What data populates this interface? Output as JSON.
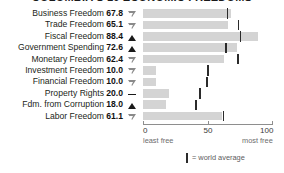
{
  "chart_data": {
    "type": "bar",
    "title": "COLOMBIA'S 10 ECONOMIC FREEDOMS",
    "xlabel": "",
    "ylabel": "",
    "xlim": [
      0,
      100
    ],
    "grid": false,
    "orientation": "horizontal",
    "legend": "= world average",
    "axis": {
      "ticks": [
        {
          "value": 0,
          "label": "0",
          "sublabel": "least free"
        },
        {
          "value": 50,
          "label": "50",
          "sublabel": ""
        },
        {
          "value": 100,
          "label": "100",
          "sublabel": "most free"
        }
      ]
    },
    "categories": [
      "Business Freedom",
      "Trade Freedom",
      "Fiscal Freedom",
      "Government Spending",
      "Monetary Freedom",
      "Investment Freedom",
      "Financial Freedom",
      "Property Rights",
      "Fdm. from Corruption",
      "Labor Freedom"
    ],
    "values": [
      67.8,
      65.1,
      88.4,
      72.6,
      62.4,
      10.0,
      10.0,
      20.0,
      18.0,
      61.1
    ],
    "world_average": [
      65.0,
      73.5,
      75.0,
      64.0,
      73.0,
      50.0,
      49.0,
      44.0,
      40.5,
      62.0
    ],
    "trend": [
      "down",
      "down",
      "up",
      "up",
      "down",
      "down",
      "down",
      "flat",
      "up",
      "down"
    ],
    "series": [
      {
        "name": "score",
        "values": [
          67.8,
          65.1,
          88.4,
          72.6,
          62.4,
          10.0,
          10.0,
          20.0,
          18.0,
          61.1
        ]
      }
    ]
  },
  "rows": [
    {
      "label": "Business Freedom",
      "value": "67.8",
      "trend": "down"
    },
    {
      "label": "Trade Freedom",
      "value": "65.1",
      "trend": "down"
    },
    {
      "label": "Fiscal Freedom",
      "value": "88.4",
      "trend": "up"
    },
    {
      "label": "Government Spending",
      "value": "72.6",
      "trend": "up"
    },
    {
      "label": "Monetary Freedom",
      "value": "62.4",
      "trend": "down"
    },
    {
      "label": "Investment Freedom",
      "value": "10.0",
      "trend": "down"
    },
    {
      "label": "Financial Freedom",
      "value": "10.0",
      "trend": "down"
    },
    {
      "label": "Property Rights",
      "value": "20.0",
      "trend": "flat"
    },
    {
      "label": "Fdm. from Corruption",
      "value": "18.0",
      "trend": "up"
    },
    {
      "label": "Labor Freedom",
      "value": "61.1",
      "trend": "down"
    }
  ],
  "colors": {
    "bar": "#d4d4d4",
    "tick": "#2b2b2b",
    "axis": "#8e8e8e",
    "text": "#231f20"
  }
}
